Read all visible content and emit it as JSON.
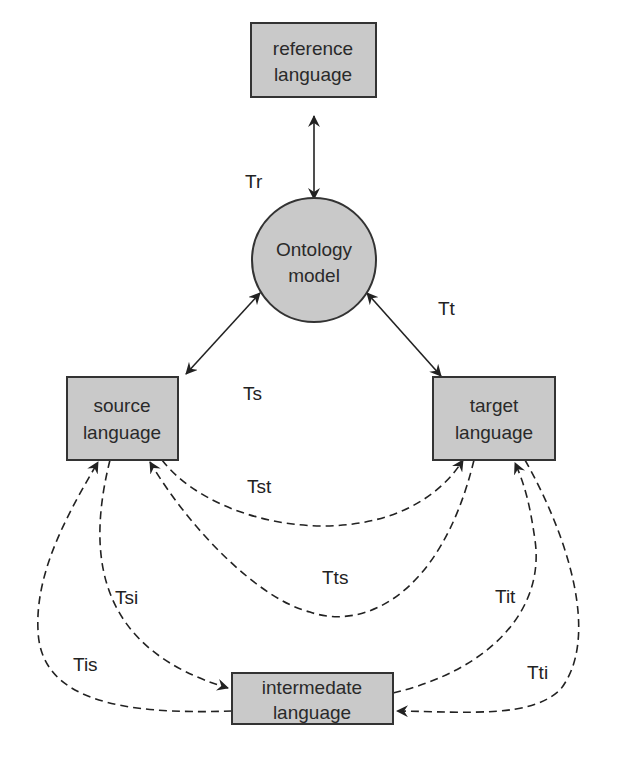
{
  "colors": {
    "node_fill": "#c9c9c9",
    "node_stroke": "#333333",
    "edge": "#222222",
    "background": "#ffffff"
  },
  "nodes": {
    "reference": {
      "line1": "reference",
      "line2": "language",
      "shape": "rectangle"
    },
    "ontology": {
      "line1": "Ontology",
      "line2": "model",
      "shape": "circle"
    },
    "source": {
      "line1": "source",
      "line2": "language",
      "shape": "rectangle"
    },
    "target": {
      "line1": "target",
      "line2": "language",
      "shape": "rectangle"
    },
    "intermediate": {
      "line1": "intermedate",
      "line2": "language",
      "shape": "rectangle"
    }
  },
  "edges": {
    "Tr": {
      "label": "Tr",
      "from": "ontology",
      "to": "reference",
      "style": "solid",
      "direction": "bidirectional"
    },
    "Ts": {
      "label": "Ts",
      "from": "ontology",
      "to": "source",
      "style": "solid",
      "direction": "bidirectional"
    },
    "Tt": {
      "label": "Tt",
      "from": "ontology",
      "to": "target",
      "style": "solid",
      "direction": "bidirectional"
    },
    "Tst": {
      "label": "Tst",
      "from": "source",
      "to": "target",
      "style": "dashed",
      "direction": "forward"
    },
    "Tts": {
      "label": "Tts",
      "from": "target",
      "to": "source",
      "style": "dashed",
      "direction": "forward"
    },
    "Tsi": {
      "label": "Tsi",
      "from": "source",
      "to": "intermediate",
      "style": "dashed",
      "direction": "forward"
    },
    "Tis": {
      "label": "Tis",
      "from": "intermediate",
      "to": "source",
      "style": "dashed",
      "direction": "forward"
    },
    "Tit": {
      "label": "Tit",
      "from": "intermediate",
      "to": "target",
      "style": "dashed",
      "direction": "forward"
    },
    "Tti": {
      "label": "Tti",
      "from": "target",
      "to": "intermediate",
      "style": "dashed",
      "direction": "forward"
    }
  }
}
